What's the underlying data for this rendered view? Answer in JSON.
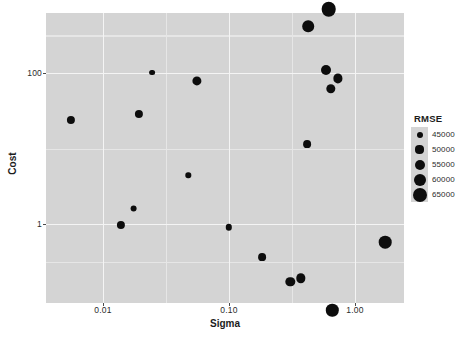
{
  "chart_data": {
    "type": "scatter",
    "title": "",
    "xlabel": "Sigma",
    "ylabel": "Cost",
    "xscale": "log10",
    "yscale": "log10",
    "xlim": [
      0.004,
      2.4
    ],
    "ylim": [
      0.1,
      900
    ],
    "xticks": [
      "0.01",
      "0.10",
      "1.00"
    ],
    "xtick_values": [
      0.01,
      0.1,
      1.0
    ],
    "yticks": [
      "1",
      "100"
    ],
    "ytick_values": [
      1,
      100
    ],
    "grid": true,
    "legend_position": "right",
    "size_legend": {
      "title": "RMSE",
      "entries": [
        {
          "label": "45000",
          "value": 45000,
          "radius_px": 3.0
        },
        {
          "label": "50000",
          "value": 50000,
          "radius_px": 4.1
        },
        {
          "label": "55000",
          "value": 55000,
          "radius_px": 5.0
        },
        {
          "label": "60000",
          "value": 60000,
          "radius_px": 6.0
        },
        {
          "label": "65000",
          "value": 65000,
          "radius_px": 7.0
        }
      ]
    },
    "points": [
      {
        "sigma": 0.0056,
        "cost": 24.0,
        "rmse": 50000,
        "radius_px": 4.1
      },
      {
        "sigma": 0.0139,
        "cost": 0.98,
        "rmse": 50000,
        "radius_px": 4.1
      },
      {
        "sigma": 0.0175,
        "cost": 1.6,
        "rmse": 47000,
        "radius_px": 3.4
      },
      {
        "sigma": 0.0194,
        "cost": 29.0,
        "rmse": 50000,
        "radius_px": 4.1
      },
      {
        "sigma": 0.0245,
        "cost": 101.0,
        "rmse": 45000,
        "radius_px": 2.9
      },
      {
        "sigma": 0.0476,
        "cost": 4.4,
        "rmse": 44000,
        "radius_px": 2.7
      },
      {
        "sigma": 0.056,
        "cost": 79.0,
        "rmse": 52000,
        "radius_px": 4.6
      },
      {
        "sigma": 0.1,
        "cost": 0.9,
        "rmse": 46000,
        "radius_px": 3.2
      },
      {
        "sigma": 0.182,
        "cost": 0.36,
        "rmse": 49000,
        "radius_px": 3.9
      },
      {
        "sigma": 0.307,
        "cost": 0.17,
        "rmse": 52000,
        "radius_px": 4.7
      },
      {
        "sigma": 0.372,
        "cost": 0.19,
        "rmse": 52000,
        "radius_px": 4.7
      },
      {
        "sigma": 0.418,
        "cost": 11.5,
        "rmse": 49000,
        "radius_px": 3.9
      },
      {
        "sigma": 0.426,
        "cost": 420.0,
        "rmse": 58000,
        "radius_px": 5.8
      },
      {
        "sigma": 0.59,
        "cost": 108.0,
        "rmse": 54000,
        "radius_px": 5.0
      },
      {
        "sigma": 0.62,
        "cost": 700.0,
        "rmse": 65000,
        "radius_px": 7.3
      },
      {
        "sigma": 0.64,
        "cost": 62.0,
        "rmse": 52000,
        "radius_px": 4.7
      },
      {
        "sigma": 0.66,
        "cost": 0.072,
        "rmse": 60000,
        "radius_px": 6.2
      },
      {
        "sigma": 0.73,
        "cost": 85.0,
        "rmse": 52000,
        "radius_px": 4.6
      },
      {
        "sigma": 1.74,
        "cost": 0.57,
        "rmse": 60000,
        "radius_px": 6.3
      }
    ]
  },
  "axes": {
    "x_title": "Sigma",
    "y_title": "Cost"
  },
  "legend": {
    "title": "RMSE",
    "items": [
      {
        "label": "45000"
      },
      {
        "label": "50000"
      },
      {
        "label": "55000"
      },
      {
        "label": "60000"
      },
      {
        "label": "65000"
      }
    ]
  },
  "colors": {
    "panel_background": "#d4d4d4",
    "gridline_major": "#f4f4f4",
    "gridline_minor": "#e6e6e6",
    "point_fill": "#0d0d0d",
    "text": "#2b2b2b",
    "page_background": "#ffffff"
  }
}
